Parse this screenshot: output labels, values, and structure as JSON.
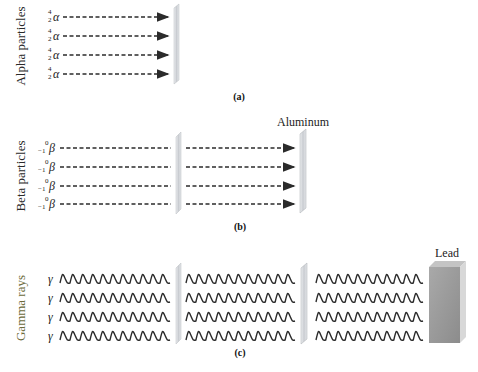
{
  "panels": {
    "a": {
      "label": "Alpha particles",
      "caption": "(a)",
      "symbol": "α",
      "mass_number": "4",
      "atomic_number": "2",
      "rows": 4,
      "barriers": [
        "paper sheet"
      ],
      "outcome": "stopped by first barrier"
    },
    "b": {
      "label": "Beta particles",
      "caption": "(b)",
      "symbol": "β",
      "mass_number": "0",
      "atomic_number": "−1",
      "rows": 4,
      "barriers": [
        "paper sheet",
        "Aluminum"
      ],
      "material_label": "Aluminum",
      "outcome": "pass first barrier, stopped by aluminum"
    },
    "c": {
      "label": "Gamma rays",
      "caption": "(c)",
      "symbol": "γ",
      "rows": 4,
      "barriers": [
        "paper sheet",
        "aluminum sheet",
        "Lead"
      ],
      "material_label": "Lead",
      "outcome": "pass paper and aluminum, stopped by lead"
    }
  },
  "colors": {
    "arrow": "#2b2b2b",
    "barrier": "#d4d6da",
    "lead": "#9a9a9a",
    "gamma_label": "#6b6a3a"
  }
}
